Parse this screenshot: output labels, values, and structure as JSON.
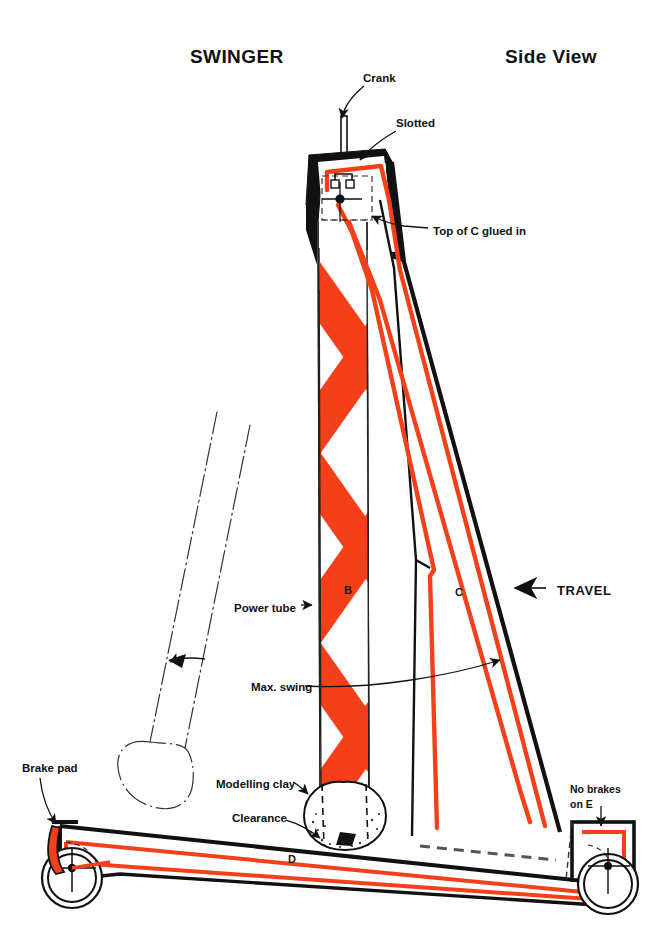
{
  "page": {
    "width": 665,
    "height": 952,
    "background": "#ffffff"
  },
  "titles": {
    "left": "SWINGER",
    "right": "Side View"
  },
  "colors": {
    "ink": "#111111",
    "red": "#F4401A",
    "paper": "#ffffff",
    "black_fill": "#111111"
  },
  "callouts": [
    {
      "id": "crank",
      "text": "Crank",
      "x": 363,
      "y": 78
    },
    {
      "id": "slotted",
      "text": "Slotted",
      "x": 396,
      "y": 123
    },
    {
      "id": "top-of-c",
      "text": "Top of C glued in",
      "x": 433,
      "y": 231
    },
    {
      "id": "travel",
      "text": "TRAVEL",
      "x": 557,
      "y": 591
    },
    {
      "id": "power-tube",
      "text": "Power tube",
      "x": 251,
      "y": 608
    },
    {
      "id": "max-swing",
      "text": "Max. swing",
      "x": 251,
      "y": 687
    },
    {
      "id": "brake-pad",
      "text": "Brake pad",
      "x": 22,
      "y": 768
    },
    {
      "id": "modelling-clay",
      "text": "Modelling clay",
      "x": 216,
      "y": 784
    },
    {
      "id": "clearance",
      "text": "Clearance",
      "x": 232,
      "y": 818
    },
    {
      "id": "no-brakes-1",
      "text": "No brakes",
      "x": 570,
      "y": 789
    },
    {
      "id": "no-brakes-2",
      "text": "on E",
      "x": 570,
      "y": 804
    }
  ],
  "part_letters": [
    {
      "id": "part-b",
      "text": "B",
      "x": 344,
      "y": 590
    },
    {
      "id": "part-c",
      "text": "C",
      "x": 455,
      "y": 592
    },
    {
      "id": "part-d",
      "text": "D",
      "x": 288,
      "y": 859
    }
  ],
  "parts_legend": {
    "B": "Power tube (vertical member with red chevron striping)",
    "C": "Diagonal brace tube",
    "D": "Base beam",
    "E": "Rear wheel block"
  },
  "annotations": {
    "modelling_clay_note": "Modelling clay ball at foot of power tube",
    "clearance_note": "Clearance between clay ball and base beam",
    "brake_pad_note": "Brake pad at front wheel",
    "no_brakes_note": "No brakes on E"
  }
}
